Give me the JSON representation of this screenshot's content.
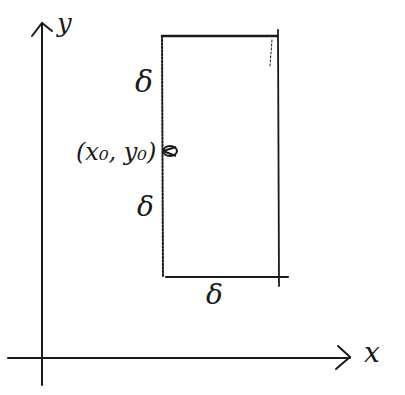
{
  "diagram": {
    "type": "hand-drawn coordinate sketch",
    "axes": {
      "x_label": "x",
      "y_label": "y"
    },
    "rectangle": {
      "left_side_upper_label": "δ",
      "left_side_lower_label": "δ",
      "bottom_label": "δ"
    },
    "point": {
      "label": "(x₀, y₀)"
    },
    "colors": {
      "ink": "#1a1a1a",
      "background": "#ffffff"
    }
  }
}
